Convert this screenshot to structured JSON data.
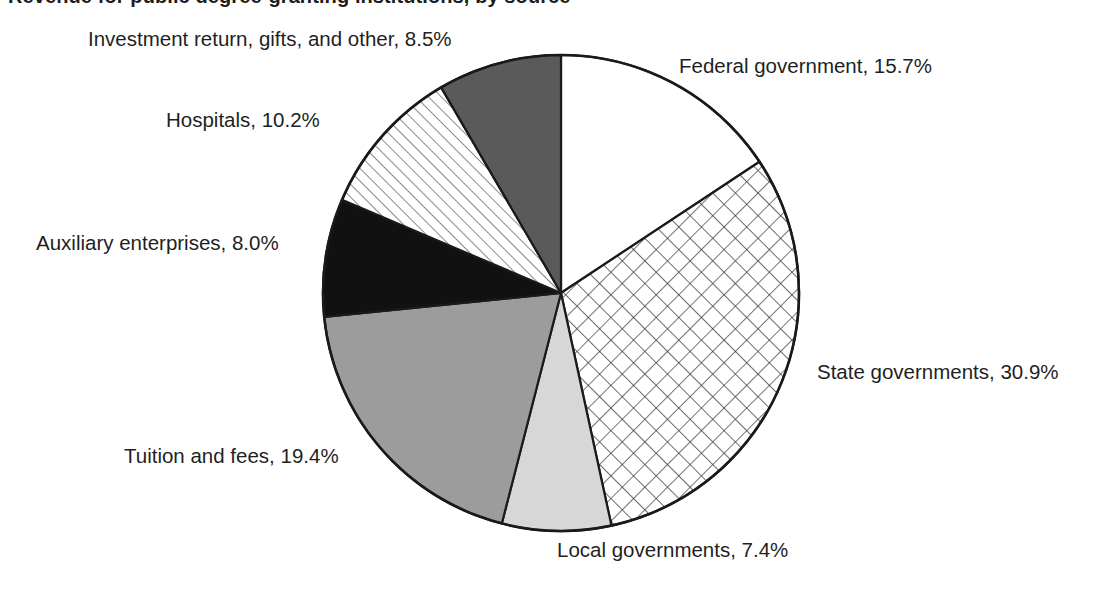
{
  "figure": {
    "title_clipped": "Revenue for public degree-granting institutions, by source",
    "background": "#ffffff",
    "text_color": "#1f1f1f",
    "outline_color": "#1a1a1a"
  },
  "chart_data": {
    "type": "pie",
    "title": "Revenue for public degree-granting institutions, by source",
    "xlabel": "",
    "ylabel": "",
    "legend_position": "none",
    "grid": false,
    "start_angle_deg": 0,
    "direction": "clockwise",
    "units": "percent",
    "total": 100.1,
    "categories": [
      "Federal government",
      "State governments",
      "Local governments",
      "Tuition and fees",
      "Auxiliary enterprises",
      "Hospitals",
      "Investment return, gifts, and other"
    ],
    "values": [
      15.7,
      30.9,
      7.4,
      19.4,
      8.0,
      10.2,
      8.5
    ],
    "slices": [
      {
        "key": "federal",
        "name": "Federal government",
        "value": 15.7,
        "label": "Federal government, 15.7%",
        "fill": "#ffffff",
        "pattern": "solid",
        "start_deg": 0.0,
        "end_deg": 56.52
      },
      {
        "key": "state",
        "name": "State governments",
        "value": 30.9,
        "label": "State governments, 30.9%",
        "fill": "#ffffff",
        "pattern": "cross-hatch-diagonal",
        "start_deg": 56.52,
        "end_deg": 167.76
      },
      {
        "key": "local",
        "name": "Local governments",
        "value": 7.4,
        "label": "Local governments, 7.4%",
        "fill": "#d7d7d7",
        "pattern": "solid",
        "start_deg": 167.76,
        "end_deg": 194.4
      },
      {
        "key": "tuition",
        "name": "Tuition and fees",
        "value": 19.4,
        "label": "Tuition and fees, 19.4%",
        "fill": "#9c9c9c",
        "pattern": "solid",
        "start_deg": 194.4,
        "end_deg": 264.24
      },
      {
        "key": "auxiliary",
        "name": "Auxiliary enterprises",
        "value": 8.0,
        "label": "Auxiliary enterprises, 8.0%",
        "fill": "#111111",
        "pattern": "solid",
        "start_deg": 264.24,
        "end_deg": 293.04
      },
      {
        "key": "hospitals",
        "name": "Hospitals",
        "value": 10.2,
        "label": "Hospitals, 10.2%",
        "fill": "#ffffff",
        "pattern": "diagonal-stripes",
        "start_deg": 293.04,
        "end_deg": 329.76
      },
      {
        "key": "investment",
        "name": "Investment return, gifts, and other",
        "value": 8.5,
        "label": "Investment return, gifts, and other, 8.5%",
        "fill": "#5a5a5a",
        "pattern": "solid",
        "start_deg": 329.76,
        "end_deg": 360.0
      }
    ]
  },
  "labels": {
    "investment": "Investment return, gifts, and other, 8.5%",
    "federal": "Federal government, 15.7%",
    "hospitals": "Hospitals, 10.2%",
    "auxiliary": "Auxiliary enterprises, 8.0%",
    "state": "State governments, 30.9%",
    "tuition": "Tuition and fees, 19.4%",
    "local": "Local governments, 7.4%"
  }
}
